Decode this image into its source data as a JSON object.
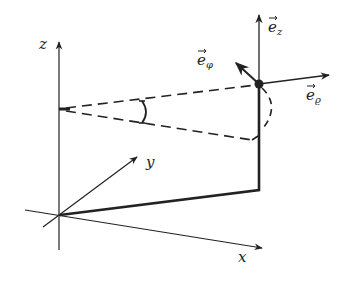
{
  "diagram": {
    "colors": {
      "stroke": "#222222",
      "background": "#ffffff"
    },
    "axes": {
      "x": {
        "label": "x"
      },
      "y": {
        "label": "y"
      },
      "z": {
        "label": "z"
      }
    },
    "vectors": {
      "e_z": {
        "base": "e",
        "sub": "z"
      },
      "e_phi": {
        "base": "e",
        "sub": "φ"
      },
      "e_rho": {
        "base": "e",
        "sub": "ϱ"
      }
    }
  }
}
